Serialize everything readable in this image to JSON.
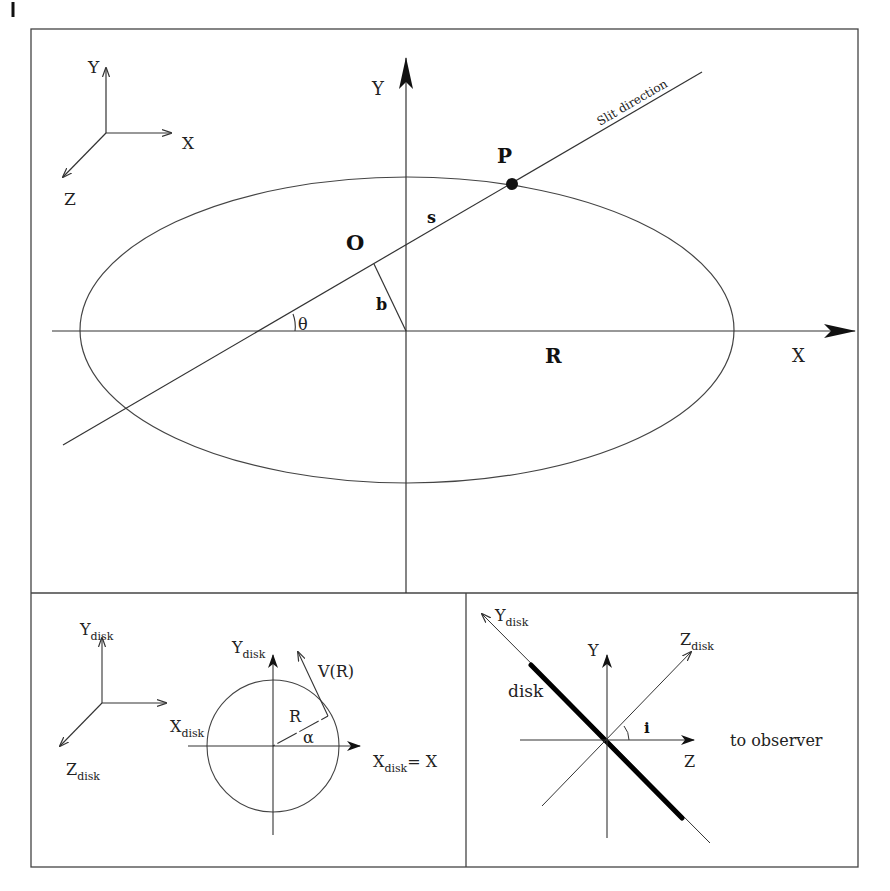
{
  "figure": {
    "corner_mark": "|",
    "top_panel": {
      "small_axes": {
        "y_label": "Y",
        "x_label": "X",
        "z_label": "Z"
      },
      "axis_y_label": "Y",
      "axis_x_label": "X",
      "slit_label": "Slit direction",
      "point_label": "P",
      "origin_label": "O",
      "s_label": "s",
      "b_label": "b",
      "theta_label": "θ",
      "r_label": "R"
    },
    "bottom_left_panel": {
      "small_axes": {
        "y_label": "Y",
        "y_sub": "disk",
        "z_label": "Z",
        "z_sub": "disk"
      },
      "circle_y_label": "Y",
      "circle_y_sub": "disk",
      "x_disk_label": "X",
      "x_disk_sub": "disk",
      "x_eq_label_main": "X",
      "x_eq_label_sub": "disk",
      "x_eq_label_tail": "= X",
      "velocity_label": "V(R)",
      "radius_label": "R",
      "alpha_label": "α"
    },
    "bottom_right_panel": {
      "ydisk_label": "Y",
      "ydisk_sub": "disk",
      "zdisk_label": "Z",
      "zdisk_sub": "disk",
      "y_label": "Y",
      "z_label": "Z",
      "disk_label": "disk",
      "inclination_label": "i",
      "observer_label": "to observer"
    }
  }
}
